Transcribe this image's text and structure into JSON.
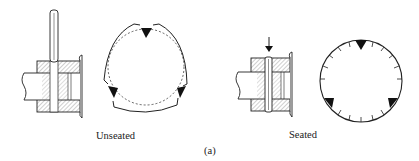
{
  "figure": {
    "panel_label": "(a)",
    "states": [
      {
        "id": "unseated",
        "label": "Unseated"
      },
      {
        "id": "seated",
        "label": "Seated"
      }
    ]
  },
  "colors": {
    "line": "#222222",
    "hatch": "#777777",
    "background": "#ffffff"
  }
}
